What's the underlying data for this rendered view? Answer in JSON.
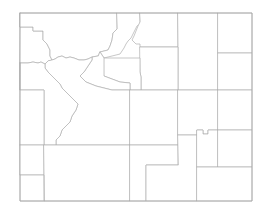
{
  "map": {
    "title": "Wyoming",
    "subject": "Wyoming county boundaries",
    "kind": "choropleth-outline-map",
    "projection_note": "plain rectangular state outline with internal county divisions",
    "background_color": "#ffffff",
    "border_color": "#a8a8a8",
    "county_fill_color": "#ffffff",
    "county_stroke_color": "#b0b0b0",
    "county_count": 23,
    "bounds": {
      "x": 20,
      "y": 13,
      "width": 232,
      "height": 188
    },
    "counties": [
      {
        "name": "Teton",
        "label": "",
        "fill": "#ffffff",
        "path": "M20,13 L20,27 L33,27 L33,31 L43,31 L43,40 L47,44 L50,50 L50,56 L52,60 L48,61 L45,64 L41,62 L38,63 L33,62 L28,63 L20,63 Z"
      },
      {
        "name": "Park",
        "label": "",
        "fill": "#ffffff",
        "path": "M20,13 L117,13 L117,29 L113,33 L112,40 L110,46 L108,50 L100,52 L98,56 L92,57 L88,59 L84,60 L79,60 L74,58 L70,57 L66,58 L62,56 L58,57 L55,59 L52,60 L50,56 L50,50 L47,44 L43,40 L43,31 L33,31 L33,27 L20,27 Z"
      },
      {
        "name": "Big Horn",
        "label": "",
        "fill": "#ffffff",
        "path": "M117,13 L140,13 L140,24 L137,26 L135,30 L133,34 L131,38 L128,41 L126,44 L124,48 L122,51 L120,54 L116,55 L112,56 L108,57 L104,58 L100,52 L108,50 L110,46 L112,40 L113,33 L117,29 Z"
      },
      {
        "name": "Sheridan",
        "label": "",
        "fill": "#ffffff",
        "path": "M140,13 L178,13 L178,47 L140,47 L140,44 L136,44 L134,42 L132,40 L134,36 L136,31 L138,26 L140,22 Z"
      },
      {
        "name": "Campbell",
        "label": "",
        "fill": "#ffffff",
        "path": "M178,13 L218,13 L218,90 L178,90 L178,47 Z"
      },
      {
        "name": "Crook",
        "label": "",
        "fill": "#ffffff",
        "path": "M218,13 L252,13 L252,53 L218,53 Z"
      },
      {
        "name": "Weston",
        "label": "",
        "fill": "#ffffff",
        "path": "M218,53 L252,53 L252,90 L218,90 Z"
      },
      {
        "name": "Johnson",
        "label": "",
        "fill": "#ffffff",
        "path": "M140,47 L178,47 L178,90 L141,90 L141,77 L140,72 Z"
      },
      {
        "name": "Washakie",
        "label": "",
        "fill": "#ffffff",
        "path": "M104,58 L140,58 L140,72 L141,77 L141,90 L130,90 L130,83 L120,82 L112,79 L104,76 Z"
      },
      {
        "name": "Hot Springs",
        "label": "",
        "fill": "#ffffff",
        "path": "M100,52 L104,58 L104,76 L112,79 L120,82 L130,83 L130,90 L112,90 L96,86 L86,82 L80,76 L84,72 L88,66 L92,60 L92,57 L98,56 Z"
      },
      {
        "name": "Fremont",
        "label": "",
        "fill": "#ffffff",
        "path": "M52,60 L55,59 L58,57 L62,56 L66,58 L70,57 L74,58 L79,60 L84,60 L88,59 L92,57 L92,60 L88,66 L84,72 L80,76 L86,82 L96,86 L112,90 L130,90 L130,145 L56,145 L56,140 L60,136 L62,130 L66,126 L70,122 L72,116 L76,110 L78,104 L74,100 L70,96 L66,92 L62,88 L60,84 L56,80 L52,76 L48,72 L45,68 L45,64 L48,61 Z"
      },
      {
        "name": "Sublette",
        "label": "",
        "fill": "#ffffff",
        "path": "M20,63 L28,63 L33,62 L38,63 L41,62 L45,64 L45,68 L48,72 L52,76 L56,80 L60,84 L62,88 L66,92 L70,96 L74,100 L78,104 L76,110 L72,116 L70,122 L66,126 L62,130 L60,136 L56,140 L56,145 L44,145 L44,90 L20,90 Z"
      },
      {
        "name": "Lincoln",
        "label": "",
        "fill": "#ffffff",
        "path": "M20,63 L20,90 L44,90 L44,145 L20,145 Z"
      },
      {
        "name": "Uinta",
        "label": "",
        "fill": "#ffffff",
        "path": "M20,145 L44,145 L44,175 L20,175 Z"
      },
      {
        "name": "Sweetwater",
        "label": "",
        "fill": "#ffffff",
        "path": "M44,145 L130,145 L130,201 L44,201 L44,175 L20,175 L20,201 L44,201 Z"
      },
      {
        "name": "Natrona",
        "label": "",
        "fill": "#ffffff",
        "path": "M130,90 L178,90 L178,145 L130,145 Z"
      },
      {
        "name": "Converse",
        "label": "",
        "fill": "#ffffff",
        "path": "M178,90 L218,90 L218,130 L208,130 L208,134 L203,134 L203,130 L197,130 L197,135 L178,135 Z"
      },
      {
        "name": "Niobrara",
        "label": "",
        "fill": "#ffffff",
        "path": "M218,90 L252,90 L252,130 L218,130 Z"
      },
      {
        "name": "Carbon",
        "label": "",
        "fill": "#ffffff",
        "path": "M130,145 L178,145 L178,165 L146,165 L146,201 L130,201 Z"
      },
      {
        "name": "Albany",
        "label": "",
        "fill": "#ffffff",
        "path": "M178,135 L197,135 L197,201 L146,201 L146,165 L178,165 Z"
      },
      {
        "name": "Platte",
        "label": "",
        "fill": "#ffffff",
        "path": "M197,130 L203,130 L203,134 L208,134 L208,130 L218,130 L218,167 L197,167 Z"
      },
      {
        "name": "Goshen",
        "label": "",
        "fill": "#ffffff",
        "path": "M218,130 L252,130 L252,167 L218,167 Z"
      },
      {
        "name": "Laramie",
        "label": "",
        "fill": "#ffffff",
        "path": "M197,167 L252,167 L252,201 L197,201 Z"
      }
    ],
    "state_outline_path": "M20,13 L252,13 L252,201 L20,201 Z"
  }
}
